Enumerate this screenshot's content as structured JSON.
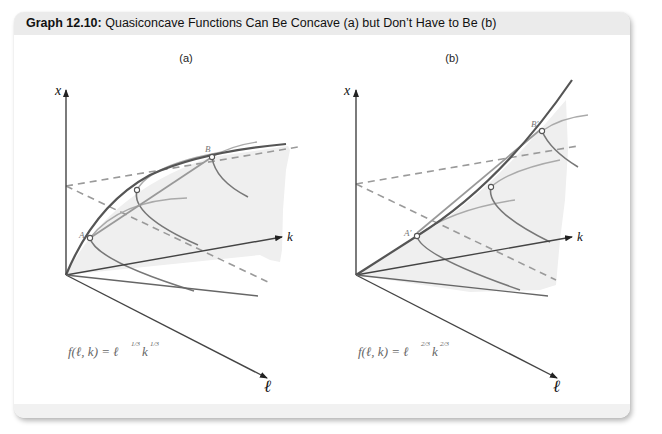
{
  "header": {
    "title_bold": "Graph 12.10:",
    "title_rest": " Quasiconcave Functions Can Be Concave (a) but Don’t Have to Be (b)"
  },
  "panels": [
    {
      "id": "a",
      "label": "(a)",
      "axes": {
        "vertical": "x",
        "depth": "k",
        "horizontal": "ℓ"
      },
      "points": [
        "A",
        "B"
      ],
      "formula": {
        "base": "f(ℓ, k) = ℓ",
        "exp1": "1/3",
        "mid": "k",
        "exp2": "1/3"
      },
      "description": "Concave function: chord from A to B lies below the surface"
    },
    {
      "id": "b",
      "label": "(b)",
      "axes": {
        "vertical": "x",
        "depth": "k",
        "horizontal": "ℓ"
      },
      "points": [
        "A′",
        "B′"
      ],
      "formula": {
        "base": "f(ℓ, k) = ℓ",
        "exp1": "2/3",
        "mid": "k",
        "exp2": "2/3"
      },
      "description": "Quasiconcave but not concave: chord from A′ to B′ lies above the surface"
    }
  ],
  "colors": {
    "axis": "#333333",
    "surface_curve": "#555555",
    "level_curve": "#777777",
    "chord": "#999999",
    "dashed": "#9a9a9a",
    "shade": "#eeeeee",
    "header_bg": "#ebebeb"
  }
}
